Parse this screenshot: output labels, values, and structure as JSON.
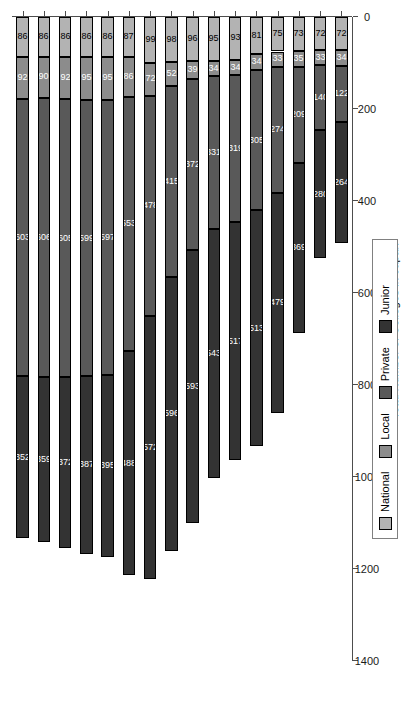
{
  "chart_data": {
    "type": "bar",
    "subtype": "stacked-bar-horizontalized",
    "title": "",
    "xlabel": "",
    "ylabel": "Total Number of Colleges in Japan",
    "orientation": "vertical-bars-rotated-90ccw",
    "grid": false,
    "legend_position": "bottom-right",
    "ylim": [
      0,
      1400
    ],
    "yticks": [
      0,
      200,
      400,
      600,
      800,
      1000,
      1200,
      1400
    ],
    "ytick_labels": [
      "0",
      "200",
      "400",
      "600",
      "800",
      "1000",
      "1200",
      "1400"
    ],
    "categories": [
      "1955",
      "1960",
      "1965",
      "1970",
      "1975",
      "1980",
      "1985",
      "1990",
      "1995",
      "2000",
      "2005",
      "2010",
      "2011",
      "2012",
      "2013",
      "2014"
    ],
    "series": [
      {
        "name": "National",
        "color": "#b3b3b3",
        "values": [
          72,
          72,
          73,
          75,
          81,
          93,
          95,
          96,
          98,
          99,
          87,
          86,
          86,
          86,
          86,
          86
        ]
      },
      {
        "name": "Local",
        "color": "#8c8c8c",
        "values": [
          34,
          33,
          35,
          33,
          34,
          34,
          34,
          39,
          52,
          72,
          86,
          95,
          95,
          92,
          90,
          92
        ]
      },
      {
        "name": "Private",
        "color": "#595959",
        "values": [
          122,
          140,
          209,
          274,
          305,
          319,
          331,
          372,
          415,
          478,
          553,
          597,
          599,
          605,
          606,
          603
        ]
      },
      {
        "name": "Junior",
        "color": "#333333",
        "values": [
          264,
          280,
          369,
          479,
          513,
          517,
          543,
          593,
          596,
          572,
          488,
          395,
          387,
          372,
          359,
          352
        ]
      }
    ],
    "totals": [
      492,
      525,
      686,
      861,
      933,
      963,
      1003,
      1100,
      1161,
      1221,
      1214,
      1173,
      1167,
      1155,
      1141,
      1133
    ]
  },
  "legend": {
    "items": [
      {
        "label": "National",
        "color": "#b3b3b3"
      },
      {
        "label": "Local",
        "color": "#8c8c8c"
      },
      {
        "label": "Private",
        "color": "#595959"
      },
      {
        "label": "Junior",
        "color": "#333333"
      }
    ]
  },
  "axis": {
    "y_title": "Total Number of Colleges in Japan"
  }
}
